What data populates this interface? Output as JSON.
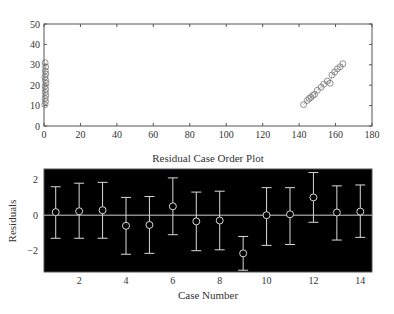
{
  "chart_data": [
    {
      "type": "scatter",
      "title": "",
      "xlabel": "",
      "ylabel": "",
      "xlim": [
        0,
        180
      ],
      "ylim": [
        0,
        50
      ],
      "xticks": [
        0,
        20,
        40,
        60,
        80,
        100,
        120,
        140,
        160,
        180
      ],
      "yticks": [
        0,
        10,
        20,
        30,
        40,
        50
      ],
      "grid": false,
      "marker": "open-circle",
      "series": [
        {
          "name": "left-cluster",
          "x": [
            0.5,
            0.8,
            0.6,
            1.0,
            0.7,
            0.9,
            0.6,
            1.1,
            0.8,
            0.5,
            1.0,
            0.7,
            0.9,
            0.6
          ],
          "y": [
            10.5,
            12,
            13.5,
            15,
            16.5,
            18,
            19.5,
            21,
            22.5,
            24,
            25.5,
            27,
            29,
            31
          ]
        },
        {
          "name": "right-cluster",
          "x": [
            142.5,
            144.5,
            145.5,
            146.5,
            147.5,
            148.5,
            150,
            152,
            153.5,
            155.5,
            157,
            158,
            159.5,
            161,
            162.5,
            164
          ],
          "y": [
            10.5,
            12.5,
            13.5,
            14,
            15,
            15.5,
            17.5,
            19,
            20.5,
            22,
            21,
            25,
            26.5,
            28,
            29,
            30.5
          ]
        }
      ]
    },
    {
      "type": "errorbar",
      "title": "Residual Case Order Plot",
      "xlabel": "Case Number",
      "ylabel": "Residuals",
      "xlim": [
        0.5,
        14.5
      ],
      "ylim": [
        -3.2,
        2.6
      ],
      "xticks": [
        2,
        4,
        6,
        8,
        10,
        12,
        14
      ],
      "yticks": [
        -2,
        0,
        2
      ],
      "background": "#000000",
      "reference_line": 0,
      "categories": [
        1,
        2,
        3,
        4,
        5,
        6,
        7,
        8,
        9,
        10,
        11,
        12,
        13,
        14
      ],
      "values": [
        0.17,
        0.22,
        0.28,
        -0.6,
        -0.55,
        0.5,
        -0.35,
        -0.3,
        -2.15,
        0.0,
        0.05,
        1.0,
        0.15,
        0.2
      ],
      "upper": [
        1.6,
        1.8,
        1.85,
        1.0,
        1.05,
        2.1,
        1.3,
        1.35,
        -1.2,
        1.55,
        1.55,
        2.4,
        1.65,
        1.7
      ],
      "lower": [
        -1.3,
        -1.3,
        -1.3,
        -2.2,
        -2.15,
        -1.1,
        -2.0,
        -1.95,
        -3.1,
        -1.7,
        -1.65,
        -0.4,
        -1.4,
        -1.25
      ]
    }
  ],
  "labels": {
    "bottom_title": "Residual Case Order Plot",
    "bottom_xlabel": "Case Number",
    "bottom_ylabel": "Residuals"
  }
}
